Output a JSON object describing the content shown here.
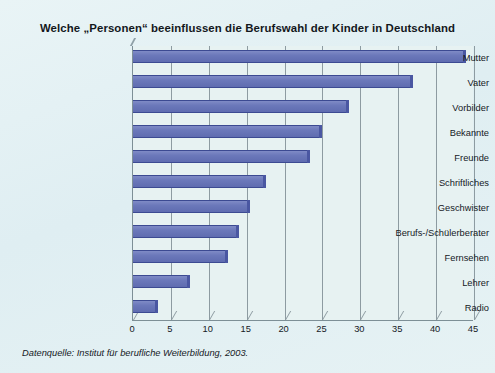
{
  "chart_data": {
    "type": "bar",
    "orientation": "horizontal",
    "title": "Welche „Personen“ beeinflussen die Berufswahl der Kinder in Deutschland",
    "xlabel": "",
    "ylabel": "",
    "xlim": [
      0,
      45
    ],
    "xticks": [
      0,
      5,
      10,
      15,
      20,
      25,
      30,
      35,
      40,
      45
    ],
    "grid": true,
    "legend": "none",
    "categories": [
      "Mutter",
      "Vater",
      "Vorbilder",
      "Bekannte",
      "Freunde",
      "Schriftliches",
      "Geschwister",
      "Berufs-/Schülerberater",
      "Fernsehen",
      "Lehrer",
      "Radio"
    ],
    "values": [
      44,
      37,
      28.5,
      25,
      23.3,
      17.5,
      15.5,
      14,
      12.5,
      7.5,
      3.3
    ],
    "annotation": "Datenquelle: Institut für berufliche Weiterbildung, 2003.",
    "colors": {
      "bar_fill": "#6b78ba",
      "bar_edge": "#3c4a92",
      "plot_background": "#e7f2f2",
      "page_background": "#e4f1f4",
      "gridline": "#8d9ba1",
      "text": "#15191f"
    }
  }
}
